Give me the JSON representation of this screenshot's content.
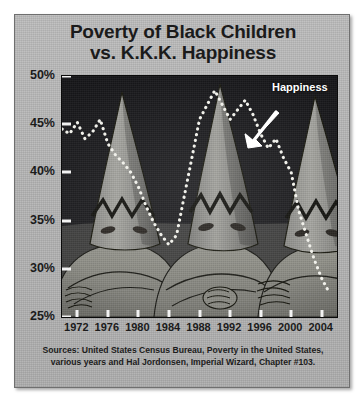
{
  "title": {
    "line1": "Poverty of Black Children",
    "line2": "vs. K.K.K. Happiness"
  },
  "annotation": {
    "label": "Happiness"
  },
  "source": {
    "line1": "Sources: United States Census Bureau, Poverty in the United States,",
    "line2": "various years and Hal Jordonsen, Imperial Wizard, Chapter #103."
  },
  "colors": {
    "panel_background": "#b6b6b6",
    "panel_border": "#6f6f6f",
    "plot_background": "#1e1e20",
    "axis_tick": "#f2f2f2",
    "text": "#1b1b1b",
    "annotation_text": "#ffffff",
    "series_dotted": "#f0f0ea",
    "robe_fill": "#9a9a96",
    "robe_shadow": "#6e6e6b",
    "robe_outline": "#15150f"
  },
  "chart_data": {
    "type": "line",
    "title": "Poverty of Black Children vs. K.K.K. Happiness",
    "xlabel": "",
    "ylabel": "",
    "grid": false,
    "legend": "none",
    "axis_note": "Single dotted white series drawn over a photo of three hooded Klan figures; the visual joke is that the same line reads as both poverty rate and Klan happiness.",
    "ylim": [
      25,
      50
    ],
    "ytick_labels": [
      "50%",
      "45%",
      "40%",
      "35%",
      "30%",
      "25%"
    ],
    "ytick_values": [
      50,
      45,
      40,
      35,
      30,
      25
    ],
    "xlim": [
      1970,
      2006
    ],
    "xtick_labels": [
      "1972",
      "1976",
      "1980",
      "1984",
      "1988",
      "1992",
      "1996",
      "2000",
      "2004"
    ],
    "xtick_values": [
      1972,
      1976,
      1980,
      1984,
      1988,
      1992,
      1996,
      2000,
      2004
    ],
    "series": [
      {
        "name": "Happiness",
        "style": "dotted",
        "color": "#f0f0ea",
        "x": [
          1970,
          1971,
          1972,
          1973,
          1974,
          1975,
          1976,
          1977,
          1978,
          1979,
          1980,
          1981,
          1982,
          1983,
          1984,
          1985,
          1986,
          1987,
          1988,
          1989,
          1990,
          1991,
          1992,
          1993,
          1994,
          1995,
          1996,
          1997,
          1998,
          1999,
          2000,
          2001,
          2002,
          2003,
          2004,
          2005
        ],
        "values": [
          44.5,
          44.0,
          45.2,
          43.5,
          44.2,
          45.5,
          43.0,
          41.8,
          41.0,
          40.0,
          38.5,
          36.5,
          34.8,
          33.5,
          32.5,
          33.5,
          37.5,
          41.5,
          45.5,
          47.0,
          48.5,
          47.0,
          45.5,
          46.5,
          47.5,
          46.0,
          44.0,
          42.5,
          43.5,
          41.5,
          40.0,
          36.0,
          33.5,
          31.0,
          29.0,
          27.5
        ]
      }
    ]
  },
  "figures": {
    "count": 3,
    "description": "three-hooded-klansmen-photo"
  }
}
